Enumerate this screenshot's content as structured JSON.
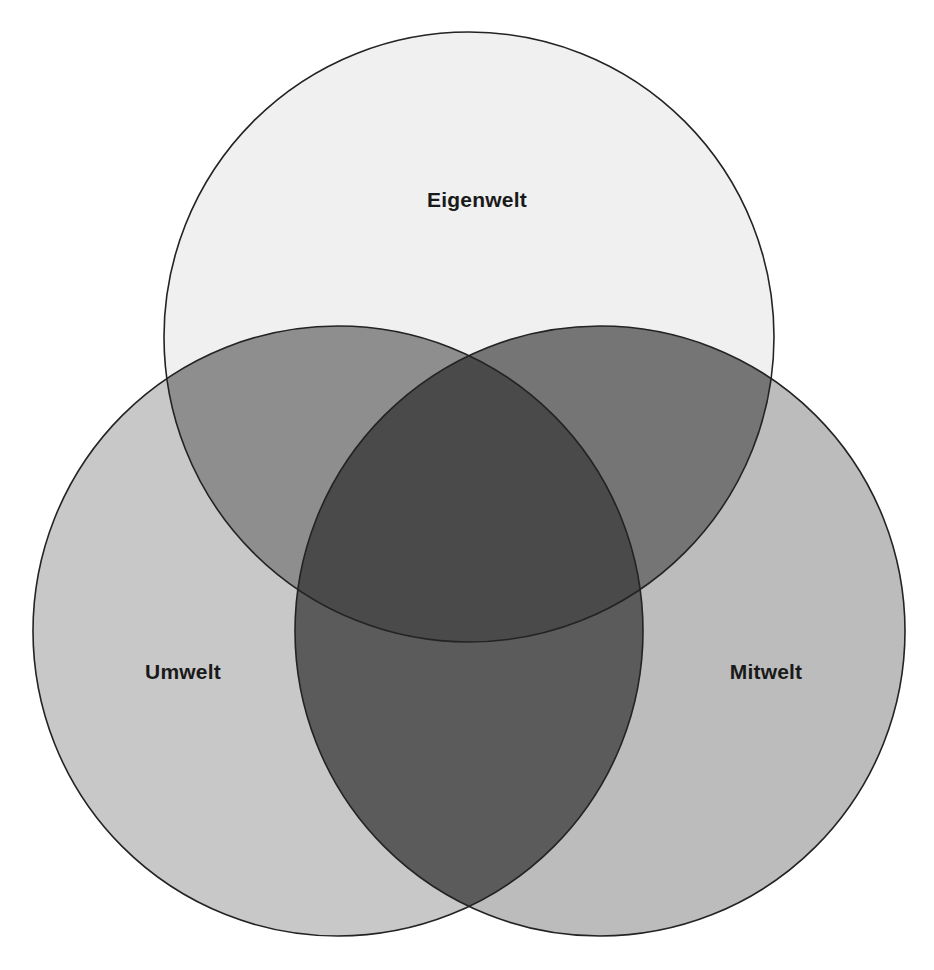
{
  "figure": {
    "background_color": "#ffffff",
    "stroke_color": "#232323",
    "stroke_width": 1.6,
    "label_color": "#1a1a1a"
  },
  "chart_data": {
    "type": "venn",
    "title": "",
    "sets": [
      {
        "id": "eigenwelt",
        "label": "Eigenwelt",
        "position": "top",
        "fill": "#f0f0f0",
        "cx": 469,
        "cy": 337,
        "r": 305,
        "label_x": 477,
        "label_y": 201
      },
      {
        "id": "umwelt",
        "label": "Umwelt",
        "position": "bottom-left",
        "fill": "#c8c8c8",
        "cx": 338,
        "cy": 631,
        "r": 305,
        "label_x": 183,
        "label_y": 673
      },
      {
        "id": "mitwelt",
        "label": "Mitwelt",
        "position": "bottom-right",
        "fill": "#bcbcbc",
        "cx": 600,
        "cy": 631,
        "r": 305,
        "label_x": 766,
        "label_y": 673
      }
    ],
    "intersections": [
      {
        "id": "eigenwelt-umwelt",
        "sets": [
          "eigenwelt",
          "umwelt"
        ],
        "fill": "#8e8e8e"
      },
      {
        "id": "eigenwelt-mitwelt",
        "sets": [
          "eigenwelt",
          "mitwelt"
        ],
        "fill": "#757575"
      },
      {
        "id": "umwelt-mitwelt",
        "sets": [
          "umwelt",
          "mitwelt"
        ],
        "fill": "#5b5b5b"
      },
      {
        "id": "eigenwelt-umwelt-mitwelt",
        "sets": [
          "eigenwelt",
          "umwelt",
          "mitwelt"
        ],
        "fill": "#4a4a4a"
      }
    ],
    "legend": null,
    "grid": false
  }
}
